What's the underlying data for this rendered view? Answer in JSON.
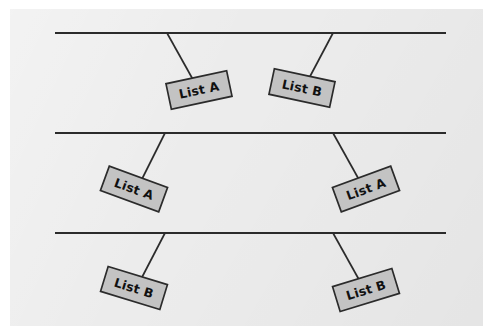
{
  "figure": {
    "background_color": "#ffffff",
    "panel_color": "#ececec",
    "line_color": "#2b2b2b",
    "box_fill_color": "#c3c3c3",
    "box_stroke_color": "#2b2b2b",
    "panel": {
      "x": 10,
      "y": 9,
      "width": 473,
      "height": 317
    }
  },
  "rows": [
    {
      "name": "row-top",
      "baseline": {
        "x1": 55,
        "y1": 33,
        "x2": 446,
        "y2": 33
      },
      "nodes": [
        {
          "label": "List A",
          "anchor_x": 167,
          "anchor_y": 33,
          "leader_to_x": 196,
          "leader_to_y": 85,
          "box_center_x": 199,
          "box_center_y": 90,
          "box_width": 62,
          "box_height": 26,
          "rotation_deg": -12
        },
        {
          "label": "List B",
          "anchor_x": 333,
          "anchor_y": 33,
          "leader_to_x": 306,
          "leader_to_y": 84,
          "box_center_x": 302,
          "box_center_y": 88,
          "box_width": 62,
          "box_height": 26,
          "rotation_deg": 12
        }
      ]
    },
    {
      "name": "row-middle",
      "baseline": {
        "x1": 55,
        "y1": 133,
        "x2": 446,
        "y2": 133
      },
      "nodes": [
        {
          "label": "List A",
          "anchor_x": 165,
          "anchor_y": 133,
          "leader_to_x": 139,
          "leader_to_y": 185,
          "box_center_x": 134,
          "box_center_y": 189,
          "box_width": 62,
          "box_height": 26,
          "rotation_deg": 20
        },
        {
          "label": "List A",
          "anchor_x": 333,
          "anchor_y": 133,
          "leader_to_x": 362,
          "leader_to_y": 185,
          "box_center_x": 366,
          "box_center_y": 189,
          "box_width": 62,
          "box_height": 26,
          "rotation_deg": -20
        }
      ]
    },
    {
      "name": "row-bottom",
      "baseline": {
        "x1": 55,
        "y1": 233,
        "x2": 446,
        "y2": 233
      },
      "nodes": [
        {
          "label": "List B",
          "anchor_x": 165,
          "anchor_y": 233,
          "leader_to_x": 139,
          "leader_to_y": 283,
          "box_center_x": 134,
          "box_center_y": 288,
          "box_width": 62,
          "box_height": 26,
          "rotation_deg": 17
        },
        {
          "label": "List B",
          "anchor_x": 333,
          "anchor_y": 233,
          "leader_to_x": 362,
          "leader_to_y": 285,
          "box_center_x": 366,
          "box_center_y": 290,
          "box_width": 62,
          "box_height": 26,
          "rotation_deg": -17
        }
      ]
    }
  ]
}
